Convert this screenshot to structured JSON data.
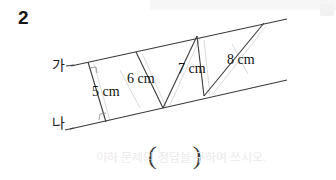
{
  "problem": {
    "number": "2"
  },
  "figure": {
    "type": "geometry-diagram",
    "line_labels": {
      "top": "가",
      "bottom": "나"
    },
    "segment_labels": [
      {
        "id": "seg-5",
        "text": "5 cm",
        "value": 5,
        "unit": "cm"
      },
      {
        "id": "seg-6",
        "text": "6 cm",
        "value": 6,
        "unit": "cm"
      },
      {
        "id": "seg-7",
        "text": "7 cm",
        "value": 7,
        "unit": "cm"
      },
      {
        "id": "seg-8",
        "text": "8 cm",
        "value": 8,
        "unit": "cm"
      }
    ],
    "colors": {
      "stroke": "#3b3b3b",
      "stroke_faint": "#c9c9c9",
      "text": "#121212",
      "background": "#ffffff"
    },
    "geometry": {
      "top_line": {
        "x1": 71,
        "y1": 66,
        "x2": 287,
        "y2": 19
      },
      "bottom_line": {
        "x1": 70,
        "y1": 129,
        "x2": 287,
        "y2": 80
      },
      "segments": [
        {
          "label": "5 cm",
          "x1": 88,
          "y1": 62,
          "x2": 106,
          "y2": 122
        },
        {
          "label": "6 cm",
          "x1": 136,
          "y1": 52,
          "x2": 163,
          "y2": 108
        },
        {
          "label": "7 cm",
          "x1": 197,
          "y1": 36,
          "x2": 163,
          "y2": 108
        },
        {
          "label": "7 cm-right",
          "x1": 197,
          "y1": 36,
          "x2": 204,
          "y2": 96
        },
        {
          "label": "8 cm",
          "x1": 264,
          "y1": 23,
          "x2": 204,
          "y2": 96
        }
      ]
    }
  },
  "answer_field": {
    "open_paren": "(",
    "close_paren": ")",
    "value": ""
  },
  "watermark": {
    "text": "이하 문제의 정답을 구하여 쓰시오."
  }
}
